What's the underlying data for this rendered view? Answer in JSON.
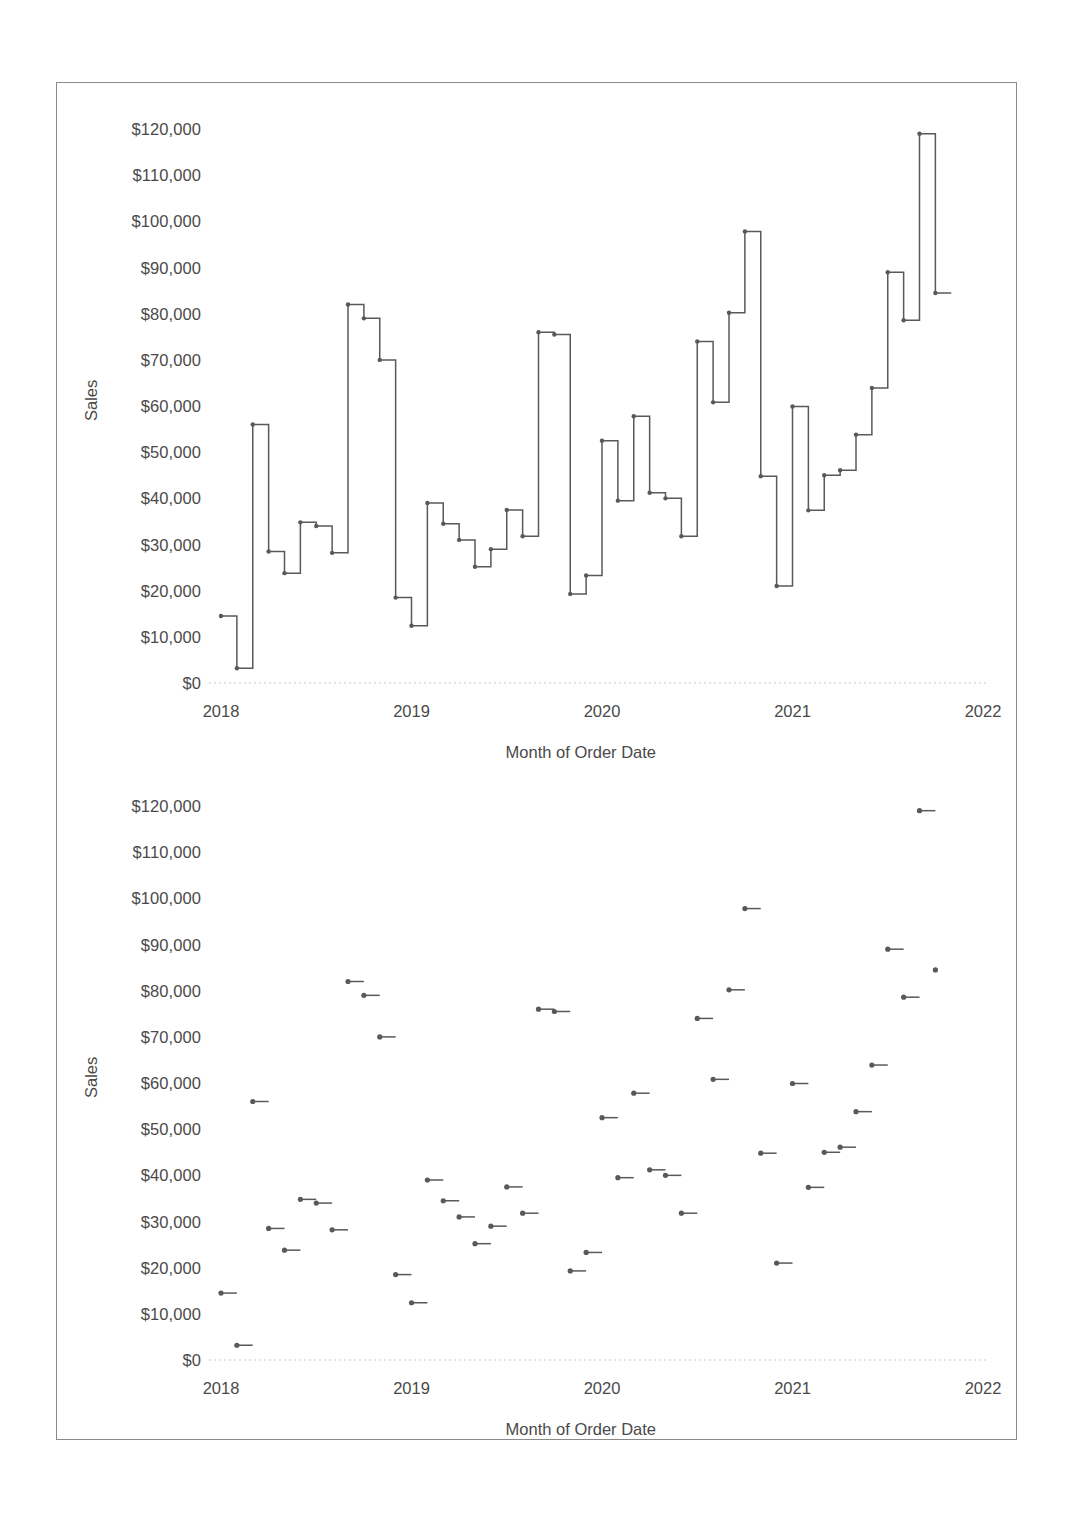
{
  "figure": {
    "axis_y_title": "Sales",
    "axis_x_title": "Month of Order Date",
    "line_color": "#595959",
    "tick_color": "#4a4a4a",
    "baseline_color": "#c9c9c9"
  },
  "chart_data": [
    {
      "type": "line",
      "subtype": "step-post",
      "title": "",
      "xlabel": "Month of Order Date",
      "ylabel": "Sales",
      "grid": false,
      "legend": "none",
      "ylim": [
        0,
        125000
      ],
      "ytick_labels": [
        "$120,000",
        "$110,000",
        "$100,000",
        "$90,000",
        "$80,000",
        "$70,000",
        "$60,000",
        "$50,000",
        "$40,000",
        "$30,000",
        "$20,000",
        "$10,000",
        "$0"
      ],
      "yticks": [
        120000,
        110000,
        100000,
        90000,
        80000,
        70000,
        60000,
        50000,
        40000,
        30000,
        20000,
        10000,
        0
      ],
      "xtick_labels": [
        "2018",
        "2019",
        "2020",
        "2021",
        "2022"
      ],
      "xticks": [
        2018,
        2019,
        2020,
        2021,
        2022
      ],
      "x": [
        "2018-01",
        "2018-02",
        "2018-03",
        "2018-04",
        "2018-05",
        "2018-06",
        "2018-07",
        "2018-08",
        "2018-09",
        "2018-10",
        "2018-11",
        "2018-12",
        "2019-01",
        "2019-02",
        "2019-03",
        "2019-04",
        "2019-05",
        "2019-06",
        "2019-07",
        "2019-08",
        "2019-09",
        "2019-10",
        "2019-11",
        "2019-12",
        "2020-01",
        "2020-02",
        "2020-03",
        "2020-04",
        "2020-05",
        "2020-06",
        "2020-07",
        "2020-08",
        "2020-09",
        "2020-10",
        "2020-11",
        "2020-12",
        "2021-01",
        "2021-02",
        "2021-03",
        "2021-04",
        "2021-05",
        "2021-06",
        "2021-07",
        "2021-08",
        "2021-09",
        "2021-10",
        "2021-11",
        "2021-12"
      ],
      "values": [
        14500,
        3200,
        56000,
        28500,
        23800,
        34800,
        34000,
        28200,
        82000,
        79000,
        70000,
        18500,
        12400,
        39000,
        34500,
        31000,
        25200,
        29000,
        37500,
        31800,
        76000,
        75500,
        19300,
        23300,
        52500,
        39500,
        57800,
        41200,
        40000,
        31800,
        74000,
        60800,
        80200,
        97800,
        44800,
        21000,
        59900,
        37400,
        45000,
        46100,
        53800,
        63900,
        89000,
        78600,
        119000,
        84500,
        0,
        0
      ],
      "series_note": "48 monthly points; final 2 entries shown only as the closing step segment"
    },
    {
      "type": "scatter",
      "subtype": "step-markers",
      "title": "",
      "xlabel": "Month of Order Date",
      "ylabel": "Sales",
      "grid": false,
      "legend": "none",
      "ylim": [
        0,
        125000
      ],
      "ytick_labels": [
        "$120,000",
        "$110,000",
        "$100,000",
        "$90,000",
        "$80,000",
        "$70,000",
        "$60,000",
        "$50,000",
        "$40,000",
        "$30,000",
        "$20,000",
        "$10,000",
        "$0"
      ],
      "yticks": [
        120000,
        110000,
        100000,
        90000,
        80000,
        70000,
        60000,
        50000,
        40000,
        30000,
        20000,
        10000,
        0
      ],
      "xtick_labels": [
        "2018",
        "2019",
        "2020",
        "2021",
        "2022"
      ],
      "xticks": [
        2018,
        2019,
        2020,
        2021,
        2022
      ],
      "x": [
        "2018-01",
        "2018-02",
        "2018-03",
        "2018-04",
        "2018-05",
        "2018-06",
        "2018-07",
        "2018-08",
        "2018-09",
        "2018-10",
        "2018-11",
        "2018-12",
        "2019-01",
        "2019-02",
        "2019-03",
        "2019-04",
        "2019-05",
        "2019-06",
        "2019-07",
        "2019-08",
        "2019-09",
        "2019-10",
        "2019-11",
        "2019-12",
        "2020-01",
        "2020-02",
        "2020-03",
        "2020-04",
        "2020-05",
        "2020-06",
        "2020-07",
        "2020-08",
        "2020-09",
        "2020-10",
        "2020-11",
        "2020-12",
        "2021-01",
        "2021-02",
        "2021-03",
        "2021-04",
        "2021-05",
        "2021-06",
        "2021-07",
        "2021-08",
        "2021-09",
        "2021-10",
        "2021-11",
        "2021-12"
      ],
      "values": [
        14500,
        3200,
        56000,
        28500,
        23800,
        34800,
        34000,
        28200,
        82000,
        79000,
        70000,
        18500,
        12400,
        39000,
        34500,
        31000,
        25200,
        29000,
        37500,
        31800,
        76000,
        75500,
        19300,
        23300,
        52500,
        39500,
        57800,
        41200,
        40000,
        31800,
        74000,
        60800,
        80200,
        97800,
        44800,
        21000,
        59900,
        37400,
        45000,
        46100,
        53800,
        63900,
        89000,
        78600,
        119000,
        84500,
        0,
        0
      ]
    }
  ]
}
